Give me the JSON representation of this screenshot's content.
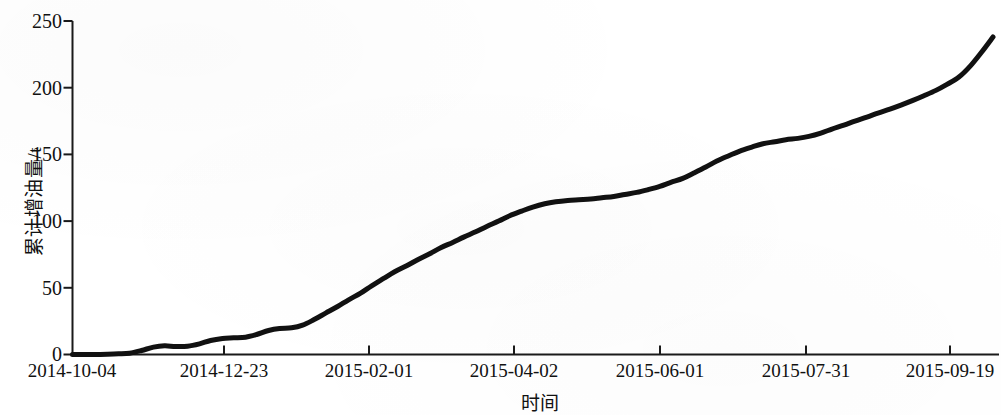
{
  "figure": {
    "background_color": "#ffffff",
    "line_color": "#111111",
    "axis_color": "#1a1a1a"
  },
  "chart_data": {
    "type": "line",
    "title": "",
    "subtitle": "",
    "xlabel": "时间",
    "ylabel": "累计增油量/t",
    "xlim": [
      "2014-10-04",
      "2015-09-19"
    ],
    "ylim": [
      0,
      250
    ],
    "yticks": [
      0,
      50,
      100,
      150,
      200,
      250
    ],
    "ytick_labels": [
      "0",
      "50",
      "100",
      "150",
      "200",
      "250"
    ],
    "xtick_labels": [
      "2014-10-04",
      "2014-12-23",
      "2015-02-01",
      "2015-04-02",
      "2015-06-01",
      "2015-07-31",
      "2015-09-19"
    ],
    "grid": false,
    "legend": null,
    "legend_position": "none",
    "line_width": 5,
    "series": [
      {
        "name": "累计增油量",
        "color": "#111111",
        "x": [
          0.0,
          0.012,
          0.025,
          0.038,
          0.05,
          0.062,
          0.075,
          0.088,
          0.1,
          0.112,
          0.125,
          0.138,
          0.15,
          0.163,
          0.175,
          0.188,
          0.2,
          0.213,
          0.225,
          0.238,
          0.25,
          0.262,
          0.275,
          0.288,
          0.3,
          0.313,
          0.325,
          0.338,
          0.35,
          0.363,
          0.375,
          0.388,
          0.4,
          0.413,
          0.425,
          0.438,
          0.45,
          0.463,
          0.475,
          0.488,
          0.5,
          0.513,
          0.525,
          0.538,
          0.55,
          0.563,
          0.575,
          0.588,
          0.6,
          0.613,
          0.625,
          0.638,
          0.65,
          0.663,
          0.675,
          0.688,
          0.7,
          0.713,
          0.725,
          0.738,
          0.75,
          0.763,
          0.775,
          0.788,
          0.8,
          0.813,
          0.825,
          0.838,
          0.85,
          0.863,
          0.875,
          0.888,
          0.9,
          0.913,
          0.925,
          0.938,
          0.95,
          0.963,
          0.975,
          0.988,
          1.0
        ],
        "y": [
          0.0,
          0.0,
          0.0,
          0.2,
          0.5,
          1.0,
          3.0,
          5.5,
          6.5,
          6.0,
          6.2,
          8.0,
          10.5,
          12.0,
          12.5,
          13.0,
          15.0,
          18.0,
          19.5,
          20.0,
          22.0,
          26.0,
          31.0,
          36.0,
          41.0,
          46.0,
          51.5,
          57.0,
          62.0,
          66.5,
          71.0,
          75.5,
          80.0,
          84.0,
          88.0,
          92.0,
          96.0,
          100.0,
          104.0,
          107.5,
          110.5,
          113.0,
          114.5,
          115.5,
          116.0,
          116.5,
          117.5,
          118.5,
          120.0,
          121.5,
          123.5,
          126.0,
          129.0,
          132.0,
          136.0,
          140.5,
          145.0,
          149.0,
          152.5,
          155.5,
          158.0,
          159.5,
          161.0,
          162.0,
          163.5,
          166.0,
          169.0,
          172.0,
          175.0,
          178.0,
          181.0,
          184.0,
          187.0,
          190.5,
          194.0,
          198.0,
          202.5,
          208.0,
          216.0,
          227.0,
          238.0
        ]
      }
    ],
    "annotations": []
  }
}
